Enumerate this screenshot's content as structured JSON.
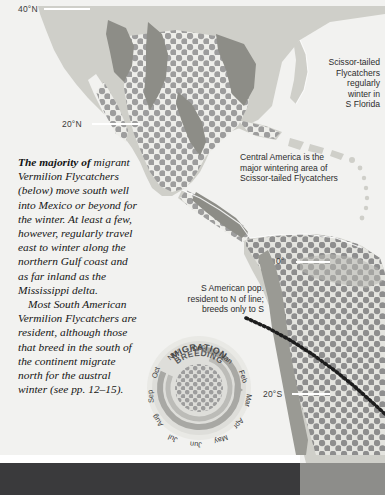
{
  "map": {
    "title": "Vermilion and Scissor-tailed Flycatcher distribution map",
    "projection_region": "North, Central and South America",
    "colors": {
      "ocean": "#f2f2f0",
      "land": "#cfcfc9",
      "land_dark": "#9a9a94",
      "range_dots": "#9a9a9a",
      "range_field": "#e6e6e2",
      "text": "#2c2c2c"
    },
    "latitude_labels": [
      {
        "label": "40°N",
        "x": 18,
        "y": 6
      },
      {
        "label": "20°N",
        "x": 62,
        "y": 120
      },
      {
        "label": "0°",
        "x": 276,
        "y": 258
      },
      {
        "label": "20°S",
        "x": 263,
        "y": 391
      }
    ]
  },
  "callouts": [
    {
      "name": "scissor-tailed-florida",
      "text": "Scissor-tailed\nFlycatchers\nregularly\nwinter in\nS Florida",
      "x": 308,
      "y": 57,
      "width": 72,
      "align": "right"
    },
    {
      "name": "central-america-wintering",
      "text": "Central America is the\nmajor wintering area of\nScissor-tailed Flycatchers",
      "x": 240,
      "y": 152,
      "width": 130,
      "align": "left"
    },
    {
      "name": "south-american-population",
      "text": "S American pop.\nresident to N of line;\nbreeds only to S",
      "x": 160,
      "y": 283,
      "width": 105,
      "align": "right"
    }
  ],
  "body_text": {
    "lead_bold": "The majority of",
    "paragraph_1_rest": " migrant Vermilion Flycatchers (below) move south well into Mexico or beyond for the winter. At least a few, however, regularly travel east to winter along the northern Gulf coast and as far inland as the Mississippi delta.",
    "paragraph_2": "Most South American Vermilion Flycatchers are resident, although those that breed in the south of the continent migrate north for the austral winter (see pp. 12–15)."
  },
  "migration_wheel": {
    "outer_ring_label": "MIGRATION",
    "inner_ring_label": "BREEDING",
    "months": [
      {
        "label": "Jan",
        "angle": 15
      },
      {
        "label": "Feb",
        "angle": 45
      },
      {
        "label": "Mar",
        "angle": 75
      },
      {
        "label": "Apr",
        "angle": 105
      },
      {
        "label": "May",
        "angle": 135
      },
      {
        "label": "Jun",
        "angle": 165
      },
      {
        "label": "Jul",
        "angle": 195
      },
      {
        "label": "Aug",
        "angle": 225
      },
      {
        "label": "Sep",
        "angle": 255
      },
      {
        "label": "Oct",
        "angle": 285
      },
      {
        "label": "Nov",
        "angle": 315
      },
      {
        "label": "Dec",
        "angle": 345
      }
    ]
  }
}
